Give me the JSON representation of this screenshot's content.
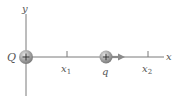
{
  "diagram": {
    "axes": {
      "x_label": "x",
      "y_label": "y",
      "axis_color": "#7a7a7a"
    },
    "charges": {
      "source": {
        "label": "Q",
        "sign": "+"
      },
      "test": {
        "label": "q",
        "sign": "+"
      }
    },
    "positions": {
      "x1_label": "x",
      "x1_sub": "1",
      "x2_label": "x",
      "x2_sub": "2"
    },
    "colors": {
      "charge_fill": "#9a9a9a",
      "arrow": "#8a8a8a",
      "text": "#555555"
    }
  }
}
